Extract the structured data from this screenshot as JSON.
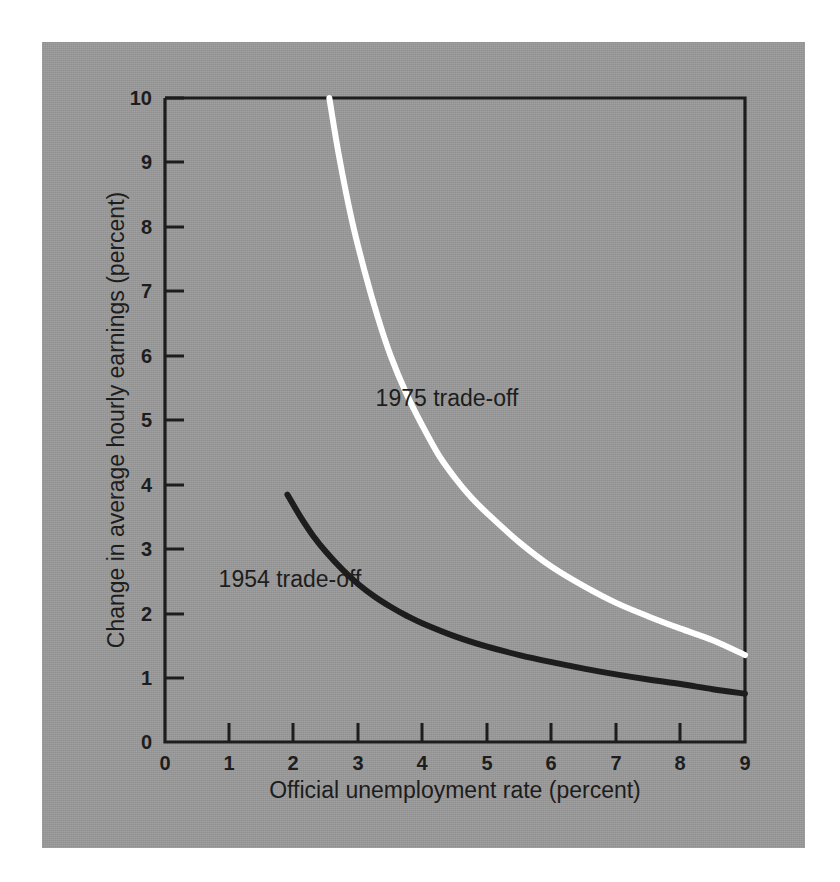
{
  "figure": {
    "background_color": "#9a9a9a",
    "page_color": "#ffffff",
    "ink_color": "#1d1d1d",
    "highlight_color": "#ffffff"
  },
  "chart_data": {
    "type": "line",
    "title": "",
    "xlabel": "Official unemployment rate (percent)",
    "ylabel": "Change in average hourly earnings (percent)",
    "xlim": [
      0,
      9
    ],
    "ylim": [
      0,
      10
    ],
    "xticks": [
      "0",
      "1",
      "2",
      "3",
      "4",
      "5",
      "6",
      "7",
      "8",
      "9"
    ],
    "yticks": [
      "0",
      "1",
      "2",
      "3",
      "4",
      "5",
      "6",
      "7",
      "8",
      "9",
      "10"
    ],
    "grid": false,
    "legend_position": "inline-annotation",
    "series": [
      {
        "name": "1975 trade-off",
        "color": "#ffffff",
        "annotation": "1975 trade-off",
        "x": [
          2.55,
          2.7,
          2.9,
          3.1,
          3.3,
          3.5,
          3.75,
          4.0,
          4.25,
          4.5,
          4.75,
          5.0,
          5.5,
          6.0,
          6.5,
          7.0,
          7.5,
          8.0,
          8.5,
          9.0
        ],
        "y": [
          10.0,
          9.1,
          8.1,
          7.3,
          6.6,
          6.0,
          5.4,
          4.9,
          4.45,
          4.1,
          3.8,
          3.55,
          3.1,
          2.72,
          2.42,
          2.16,
          1.95,
          1.76,
          1.58,
          1.35
        ]
      },
      {
        "name": "1954 trade-off",
        "color": "#1d1d1d",
        "annotation": "1954 trade-off",
        "x": [
          1.9,
          2.1,
          2.3,
          2.5,
          2.75,
          3.0,
          3.25,
          3.5,
          3.75,
          4.0,
          4.5,
          5.0,
          5.5,
          6.0,
          6.5,
          7.0,
          7.5,
          8.0,
          8.5,
          9.0
        ],
        "y": [
          3.84,
          3.5,
          3.2,
          2.95,
          2.68,
          2.45,
          2.26,
          2.1,
          1.96,
          1.84,
          1.64,
          1.48,
          1.35,
          1.24,
          1.14,
          1.05,
          0.97,
          0.9,
          0.82,
          0.75
        ]
      }
    ]
  }
}
